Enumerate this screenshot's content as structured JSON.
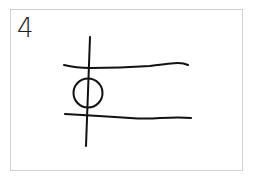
{
  "card": {
    "number": "4",
    "border_color": "#cfcfcf",
    "stroke_color": "#111111"
  },
  "sketch": {
    "description": "hand-drawn symbol: vertical line crossing two roughly horizontal lines with a circle between them",
    "elements": [
      "vertical-line",
      "top-horizontal-line",
      "bottom-horizontal-line",
      "circle"
    ]
  }
}
